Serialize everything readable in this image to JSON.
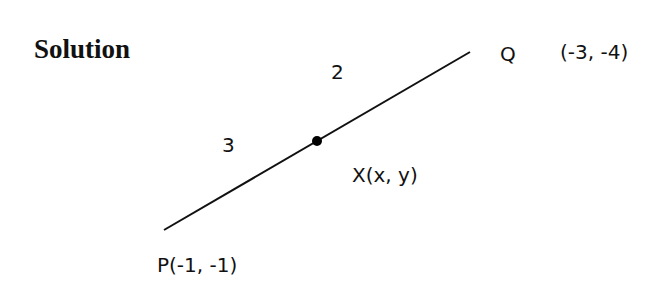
{
  "title": "Solution",
  "points": {
    "P": {
      "label": "P(-1, -1)"
    },
    "Q": {
      "label": "Q",
      "coords": "(-3, -4)"
    },
    "X": {
      "label": "X(x, y)"
    }
  },
  "ratio": {
    "PX": "3",
    "XQ": "2"
  },
  "colors": {
    "line": "#111111",
    "text": "#111111",
    "background": "#ffffff"
  }
}
